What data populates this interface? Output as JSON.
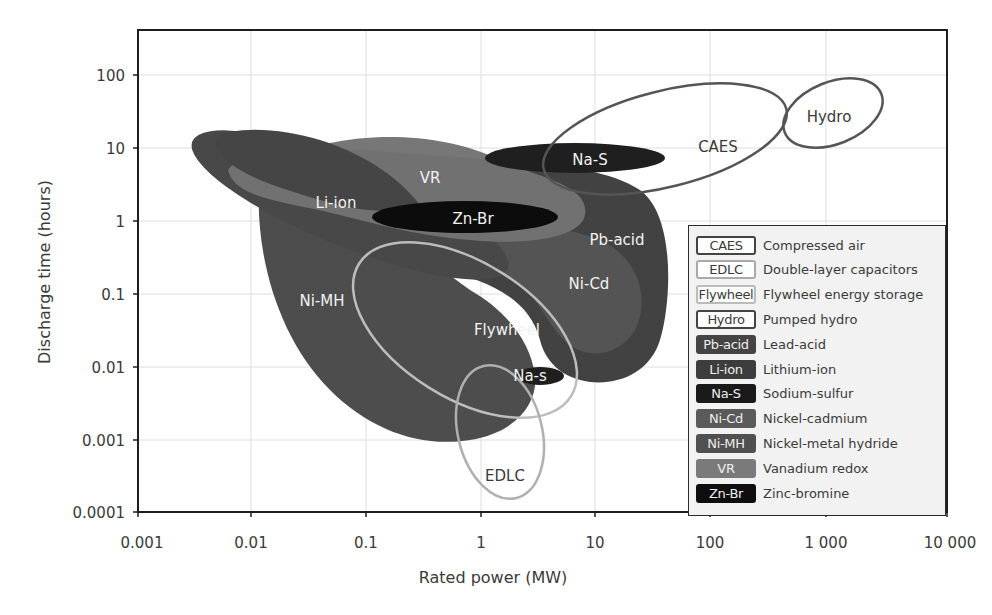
{
  "chart_data": {
    "type": "region-bubble",
    "title": "",
    "xlabel": "Rated power (MW)",
    "ylabel": "Discharge time (hours)",
    "xscale": "log",
    "yscale": "log",
    "xlim": [
      0.001,
      10000
    ],
    "ylim": [
      0.0001,
      500
    ],
    "grid": true,
    "x_ticks": [
      "0.001",
      "0.01",
      "0.1",
      "1",
      "10",
      "100",
      "1 000",
      "10 000"
    ],
    "y_ticks": [
      "100",
      "10",
      "1",
      "0.1",
      "0.01",
      "0.001",
      "0.0001"
    ],
    "legend_position": "lower right",
    "series": [
      {
        "code": "CAES",
        "name": "Compressed air",
        "style": "outline",
        "color": "#555555",
        "power_MW": [
          2,
          400
        ],
        "time_h": [
          1,
          30
        ]
      },
      {
        "code": "EDLC",
        "name": "Double-layer capacitors",
        "style": "outline",
        "color": "#b0b0b0",
        "power_MW": [
          0.8,
          3
        ],
        "time_h": [
          0.0002,
          0.006
        ]
      },
      {
        "code": "Flywheel",
        "name": "Flywheel energy storage",
        "style": "outline",
        "color": "#b8b8b8",
        "power_MW": [
          0.12,
          70
        ],
        "time_h": [
          0.002,
          0.3
        ]
      },
      {
        "code": "Hydro",
        "name": "Pumped hydro",
        "style": "outline",
        "color": "#555555",
        "power_MW": [
          300,
          5000
        ],
        "time_h": [
          6,
          80
        ]
      },
      {
        "code": "Pb-acid",
        "name": "Lead-acid",
        "style": "filled",
        "color": "#444444",
        "power_MW": [
          0.01,
          70
        ],
        "time_h": [
          0.003,
          10
        ]
      },
      {
        "code": "Li-ion",
        "name": "Lithium-ion",
        "style": "filled",
        "color": "#474747",
        "power_MW": [
          0.005,
          2
        ],
        "time_h": [
          0.1,
          15
        ]
      },
      {
        "code": "Na-S",
        "name": "Sodium-sulfur",
        "style": "filled",
        "color": "#1e1e1e",
        "power_MW": [
          1,
          50
        ],
        "time_h": [
          5,
          10
        ]
      },
      {
        "code": "Ni-Cd",
        "name": "Nickel-cadmium",
        "style": "filled",
        "color": "#555555",
        "power_MW": [
          0.5,
          50
        ],
        "time_h": [
          0.005,
          2
        ]
      },
      {
        "code": "Ni-MH",
        "name": "Nickel-metal hydride",
        "style": "filled",
        "color": "#4d4d4d",
        "power_MW": [
          0.01,
          3
        ],
        "time_h": [
          0.001,
          10
        ]
      },
      {
        "code": "VR",
        "name": "Vanadium redox",
        "style": "filled",
        "color": "#747474",
        "power_MW": [
          0.005,
          20
        ],
        "time_h": [
          0.5,
          12
        ]
      },
      {
        "code": "Zn-Br",
        "name": "Zinc-bromine",
        "style": "filled",
        "color": "#0a0a0a",
        "power_MW": [
          0.1,
          5
        ],
        "time_h": [
          0.8,
          1.6
        ]
      }
    ],
    "annotations": [
      {
        "text": "Na-s",
        "note": "small sodium-sulfur region near 3 MW, 0.005 h"
      }
    ]
  },
  "axes": {
    "xlabel": "Rated power (MW)",
    "ylabel": "Discharge time (hours)",
    "x_ticks": [
      "0.001",
      "0.01",
      "0.1",
      "1",
      "10",
      "100",
      "1 000",
      "10 000"
    ],
    "y_ticks": [
      "100",
      "10",
      "1",
      "0.1",
      "0.01",
      "0.001",
      "0.0001"
    ]
  },
  "labels": {
    "caes": "CAES",
    "hydro": "Hydro",
    "nas": "Na-S",
    "nas_small": "Na-s",
    "vr": "VR",
    "liion": "Li-ion",
    "znbr": "Zn-Br",
    "pbacid": "Pb-acid",
    "nicd": "Ni-Cd",
    "nimh": "Ni-MH",
    "flywheel": "Flywheel",
    "edlc": "EDLC"
  },
  "legend": [
    {
      "code": "CAES",
      "name": "Compressed air",
      "bg": "#ffffff",
      "border": "#444444",
      "fg": "#3a3a3a"
    },
    {
      "code": "EDLC",
      "name": "Double-layer capacitors",
      "bg": "#ffffff",
      "border": "#aaaaaa",
      "fg": "#3a3a3a"
    },
    {
      "code": "Flywheel",
      "name": "Flywheel energy storage",
      "bg": "#ffffff",
      "border": "#bbbbbb",
      "fg": "#3a3a3a"
    },
    {
      "code": "Hydro",
      "name": "Pumped hydro",
      "bg": "#ffffff",
      "border": "#444444",
      "fg": "#3a3a3a"
    },
    {
      "code": "Pb-acid",
      "name": "Lead-acid",
      "bg": "#444444",
      "border": "#444444",
      "fg": "#eeeeee"
    },
    {
      "code": "Li-ion",
      "name": "Lithium-ion",
      "bg": "#3d3d3d",
      "border": "#3d3d3d",
      "fg": "#eeeeee"
    },
    {
      "code": "Na-S",
      "name": "Sodium-sulfur",
      "bg": "#1a1a1a",
      "border": "#1a1a1a",
      "fg": "#eeeeee"
    },
    {
      "code": "Ni-Cd",
      "name": "Nickel-cadmium",
      "bg": "#5a5a5a",
      "border": "#5a5a5a",
      "fg": "#eeeeee"
    },
    {
      "code": "Ni-MH",
      "name": "Nickel-metal hydride",
      "bg": "#505050",
      "border": "#505050",
      "fg": "#eeeeee"
    },
    {
      "code": "VR",
      "name": "Vanadium redox",
      "bg": "#7a7a7a",
      "border": "#7a7a7a",
      "fg": "#eeeeee"
    },
    {
      "code": "Zn-Br",
      "name": "Zinc-bromine",
      "bg": "#0e0e0e",
      "border": "#0e0e0e",
      "fg": "#eeeeee"
    }
  ]
}
